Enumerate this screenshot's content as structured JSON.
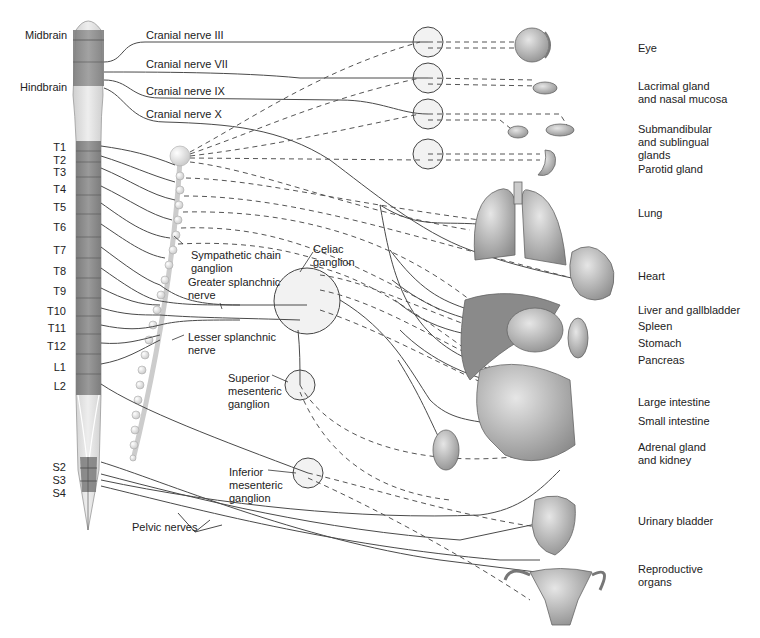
{
  "brain_labels": [
    {
      "text": "Midbrain",
      "x": 25,
      "y": 29
    },
    {
      "text": "Hindbrain",
      "x": 20,
      "y": 81
    }
  ],
  "spinal_segments": [
    {
      "text": "T1",
      "y": 141
    },
    {
      "text": "T2",
      "y": 154
    },
    {
      "text": "T3",
      "y": 166
    },
    {
      "text": "T4",
      "y": 183
    },
    {
      "text": "T5",
      "y": 201
    },
    {
      "text": "T6",
      "y": 221
    },
    {
      "text": "T7",
      "y": 244
    },
    {
      "text": "T8",
      "y": 265
    },
    {
      "text": "T9",
      "y": 285
    },
    {
      "text": "T10",
      "y": 305
    },
    {
      "text": "T11",
      "y": 322
    },
    {
      "text": "T12",
      "y": 340
    },
    {
      "text": "L1",
      "y": 361
    },
    {
      "text": "L2",
      "y": 380
    },
    {
      "text": "S2",
      "y": 461
    },
    {
      "text": "S3",
      "y": 474
    },
    {
      "text": "S4",
      "y": 487
    }
  ],
  "cranial_nerves": [
    {
      "text": "Cranial nerve III",
      "x": 146,
      "y": 29
    },
    {
      "text": "Cranial nerve VII",
      "x": 146,
      "y": 58
    },
    {
      "text": "Cranial nerve IX",
      "x": 146,
      "y": 85
    },
    {
      "text": "Cranial nerve X",
      "x": 146,
      "y": 108
    }
  ],
  "ganglion_labels": [
    {
      "text": "Sympathetic chain\nganglion",
      "x": 191,
      "y": 249
    },
    {
      "text": "Celiac\nganglion",
      "x": 313,
      "y": 243
    },
    {
      "text": "Greater splanchnic\nnerve",
      "x": 188,
      "y": 276
    },
    {
      "text": "Lesser splanchnic\nnerve",
      "x": 188,
      "y": 331
    },
    {
      "text": "Superior\nmesenteric\nganglion",
      "x": 228,
      "y": 372
    },
    {
      "text": "Inferior\nmesenteric\nganglion",
      "x": 229,
      "y": 466
    },
    {
      "text": "Pelvic nerves",
      "x": 132,
      "y": 521
    }
  ],
  "organ_labels": [
    {
      "text": "Eye",
      "x": 638,
      "y": 42
    },
    {
      "text": "Lacrimal gland\nand nasal mucosa",
      "x": 638,
      "y": 80
    },
    {
      "text": "Submandibular\nand sublingual\nglands",
      "x": 638,
      "y": 123
    },
    {
      "text": "Parotid gland",
      "x": 638,
      "y": 163
    },
    {
      "text": "Lung",
      "x": 638,
      "y": 207
    },
    {
      "text": "Heart",
      "x": 638,
      "y": 270
    },
    {
      "text": "Liver and gallbladder",
      "x": 638,
      "y": 304
    },
    {
      "text": "Spleen",
      "x": 638,
      "y": 320
    },
    {
      "text": "Stomach",
      "x": 638,
      "y": 337
    },
    {
      "text": "Pancreas",
      "x": 638,
      "y": 354
    },
    {
      "text": "Large intestine",
      "x": 638,
      "y": 396
    },
    {
      "text": "Small intestine",
      "x": 638,
      "y": 415
    },
    {
      "text": "Adrenal gland\nand kidney",
      "x": 638,
      "y": 441
    },
    {
      "text": "Urinary bladder",
      "x": 638,
      "y": 515
    },
    {
      "text": "Reproductive\norgans",
      "x": 638,
      "y": 563
    }
  ],
  "colors": {
    "background": "#ffffff",
    "spinal_dark": "#8a8a8a",
    "spinal_light": "#dcdcdc",
    "nerve_line": "#4a4a4a",
    "ganglion_fill": "#f0f0f0",
    "organ_fill": "#b5b5b5"
  }
}
